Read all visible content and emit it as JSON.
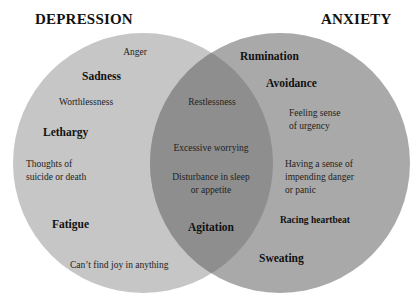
{
  "titles": {
    "left": "DEPRESSION",
    "right": "ANXIETY"
  },
  "colors": {
    "left_circle": "#c6c6c6",
    "right_circle": "#a9a9a9",
    "overlap": "#8e8e8e",
    "background": "#ffffff",
    "text": "#1a1a1a"
  },
  "depression_only": {
    "anger": "Anger",
    "sadness": "Sadness",
    "worthlessness": "Worthlessness",
    "lethargy": "Lethargy",
    "thoughts_line1": "Thoughts of",
    "thoughts_line2": "suicide or death",
    "fatigue": "Fatigue",
    "no_joy": "Can’t find joy in anything"
  },
  "shared": {
    "restlessness": "Restlessness",
    "excessive_worrying": "Excessive worrying",
    "disturbance_line1": "Disturbance in sleep",
    "disturbance_line2": "or appetite",
    "agitation": "Agitation"
  },
  "anxiety_only": {
    "rumination": "Rumination",
    "avoidance": "Avoidance",
    "urgency_line1": "Feeling sense",
    "urgency_line2": "of urgency",
    "danger_line1": "Having a sense of",
    "danger_line2": "impending danger",
    "danger_line3": "or panic",
    "racing_heartbeat": "Racing heartbeat",
    "sweating": "Sweating"
  }
}
